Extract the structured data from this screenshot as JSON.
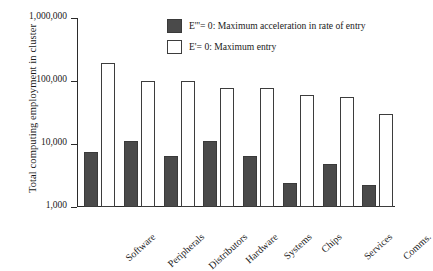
{
  "chart_data": {
    "type": "bar",
    "title": "",
    "xlabel": "",
    "ylabel": "Total computing employment in cluster",
    "yscale": "log",
    "ylim": [
      1000,
      1000000
    ],
    "ytick_labels": [
      "1,000,000",
      "100,000",
      "10,000",
      "1,000"
    ],
    "ytick_values": [
      1000000,
      100000,
      10000,
      1000
    ],
    "grid": false,
    "legend_position": "top-right",
    "categories": [
      "Software",
      "Peripherals",
      "Distributors",
      "Hardware",
      "Systems",
      "Chips",
      "Services",
      "Comms."
    ],
    "series": [
      {
        "name": "E'''= 0: Maximum acceleration in rate of entry",
        "color": "#4a4a4a",
        "values": [
          7500,
          11000,
          6500,
          11000,
          6500,
          2400,
          4800,
          2200
        ]
      },
      {
        "name": "E'= 0: Maximum entry",
        "color": "#ffffff",
        "values": [
          190000,
          100000,
          100000,
          78000,
          78000,
          60000,
          55000,
          30000
        ]
      }
    ]
  },
  "legend": {
    "items": [
      {
        "label": "E'''= 0: Maximum acceleration in rate of entry",
        "swatch": "dark"
      },
      {
        "label": "E'= 0: Maximum entry",
        "swatch": "light"
      }
    ]
  },
  "axes": {
    "y_title": "Total computing employment in cluster"
  }
}
